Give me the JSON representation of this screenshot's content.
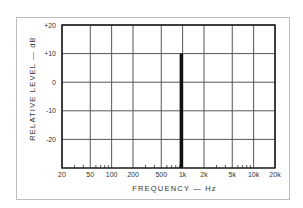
{
  "chart_data": {
    "type": "bar",
    "title": "",
    "xlabel": "FREQUENCY — Hz",
    "ylabel": "RELATIVE LEVEL — dB",
    "xscale": "log",
    "xlim": [
      20,
      20000
    ],
    "ylim": [
      -30,
      20
    ],
    "grid": true,
    "legend": "none",
    "x_ticks": [
      "20",
      "50",
      "100",
      "200",
      "500",
      "1k",
      "2k",
      "5k",
      "10k",
      "20k"
    ],
    "x_tick_values": [
      20,
      50,
      100,
      200,
      500,
      1000,
      2000,
      5000,
      10000,
      20000
    ],
    "y_ticks": [
      "+20",
      "+10",
      "0",
      "-10",
      "-20"
    ],
    "y_tick_values": [
      20,
      10,
      0,
      -10,
      -20
    ],
    "categories": [
      "1k"
    ],
    "x": [
      1000
    ],
    "values": [
      10
    ],
    "series": [
      {
        "name": "Test tone",
        "x": [
          1000
        ],
        "values": [
          10
        ],
        "baseline": -30,
        "color": "#000000"
      }
    ]
  },
  "colors": {
    "grid": "#555555",
    "axis": "#1a1a1a",
    "bar": "#111111",
    "frame": "#bdbdbd"
  }
}
